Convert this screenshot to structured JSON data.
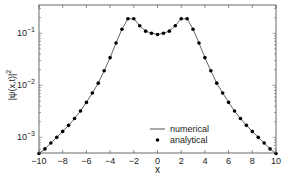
{
  "chart_data": {
    "type": "line",
    "title": "",
    "xlabel": "x",
    "ylabel": "|ψ(x,t)|²",
    "xlim": [
      -10,
      10
    ],
    "ylim": [
      0.0005,
      0.35
    ],
    "yscale": "log",
    "grid": false,
    "legend_position": "lower center (inside axes)",
    "x_ticks": [
      -10,
      -8,
      -6,
      -4,
      -2,
      0,
      2,
      4,
      6,
      8,
      10
    ],
    "y_ticks": [
      "10^-3",
      "10^-2",
      "10^-1"
    ],
    "y_tick_values": [
      0.001,
      0.01,
      0.1
    ],
    "series": [
      {
        "name": "numerical",
        "style": "line",
        "color": "#555555",
        "x": [
          -10,
          -9.5,
          -9,
          -8.5,
          -8,
          -7.5,
          -7,
          -6.5,
          -6,
          -5.5,
          -5,
          -4.5,
          -4,
          -3.5,
          -3,
          -2.5,
          -2,
          -1.5,
          -1,
          -0.5,
          0,
          0.5,
          1,
          1.5,
          2,
          2.5,
          3,
          3.5,
          4,
          4.5,
          5,
          5.5,
          6,
          6.5,
          7,
          7.5,
          8,
          8.5,
          9,
          9.5,
          10
        ],
        "values": [
          0.00049,
          0.0006,
          0.00078,
          0.001,
          0.0013,
          0.0017,
          0.0023,
          0.0032,
          0.0047,
          0.0071,
          0.011,
          0.019,
          0.034,
          0.065,
          0.12,
          0.19,
          0.19,
          0.14,
          0.11,
          0.1,
          0.095,
          0.1,
          0.11,
          0.14,
          0.19,
          0.19,
          0.12,
          0.065,
          0.034,
          0.019,
          0.011,
          0.0071,
          0.0047,
          0.0032,
          0.0023,
          0.0017,
          0.0013,
          0.001,
          0.00078,
          0.0006,
          0.00049
        ]
      },
      {
        "name": "analytical",
        "style": "markers",
        "color": "#000000",
        "x": [
          -10,
          -9.5,
          -9,
          -8.5,
          -8,
          -7.5,
          -7,
          -6.5,
          -6,
          -5.5,
          -5,
          -4.5,
          -4,
          -3.5,
          -3,
          -2.5,
          -2,
          -1.5,
          -1,
          -0.5,
          0,
          0.5,
          1,
          1.5,
          2,
          2.5,
          3,
          3.5,
          4,
          4.5,
          5,
          5.5,
          6,
          6.5,
          7,
          7.5,
          8,
          8.5,
          9,
          9.5,
          10
        ],
        "values": [
          0.00049,
          0.0006,
          0.00078,
          0.001,
          0.0013,
          0.0017,
          0.0023,
          0.0032,
          0.0047,
          0.0071,
          0.011,
          0.019,
          0.034,
          0.065,
          0.12,
          0.19,
          0.19,
          0.14,
          0.11,
          0.1,
          0.095,
          0.1,
          0.11,
          0.14,
          0.19,
          0.19,
          0.12,
          0.065,
          0.034,
          0.019,
          0.011,
          0.0071,
          0.0047,
          0.0032,
          0.0023,
          0.0017,
          0.0013,
          0.001,
          0.00078,
          0.0006,
          0.00049
        ]
      }
    ]
  },
  "axes": {
    "xlabel": "x",
    "ylabel_main": "|ψ(x,t)|",
    "ylabel_sup": "2",
    "x_tick_labels": [
      "−10",
      "−8",
      "−6",
      "−4",
      "−2",
      "0",
      "2",
      "4",
      "6",
      "8",
      "10"
    ],
    "y_tick_base": "10",
    "y_tick_exps": [
      "−1",
      "−2",
      "−3"
    ]
  },
  "legend": {
    "items": [
      {
        "label": "numerical",
        "symbol": "line"
      },
      {
        "label": "analytical",
        "symbol": "dot"
      }
    ]
  }
}
